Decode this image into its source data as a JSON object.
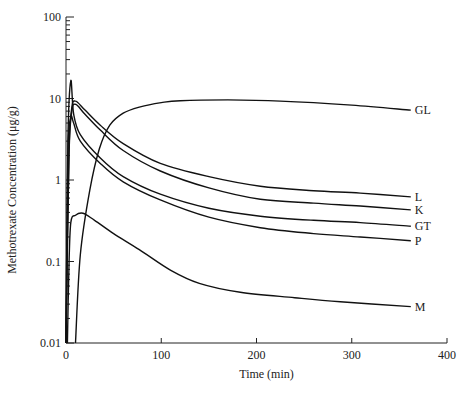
{
  "chart_data": {
    "type": "line",
    "title": "",
    "xlabel": "Time (min)",
    "ylabel": "Methotrexate Concentration (μg/g)",
    "xlim": [
      0,
      400
    ],
    "ylim": [
      0.01,
      100
    ],
    "yscale": "log",
    "grid": false,
    "legend": "direct labels at right end of curves",
    "x_ticks": [
      0,
      100,
      200,
      300,
      400
    ],
    "x_tick_labels": [
      "0",
      "100",
      "200",
      "300",
      "400"
    ],
    "y_ticks": [
      0.01,
      0.1,
      1,
      10,
      100
    ],
    "y_tick_labels": [
      "0.01",
      "0.1",
      "1",
      "10",
      "100"
    ],
    "series": [
      {
        "name": "GL",
        "x": [
          10,
          15,
          25,
          35,
          46,
          60,
          78,
          100,
          120,
          170,
          225,
          300,
          362
        ],
        "y": [
          0.01,
          0.12,
          0.75,
          2.4,
          4.7,
          6.6,
          7.9,
          8.9,
          9.4,
          9.6,
          9.3,
          8.3,
          7.2
        ]
      },
      {
        "name": "L",
        "x": [
          0,
          3,
          6,
          10,
          20,
          36,
          60,
          99,
          150,
          204,
          260,
          309,
          362
        ],
        "y": [
          0.01,
          2.0,
          7.5,
          9.3,
          7.2,
          4.7,
          2.8,
          1.6,
          1.1,
          0.84,
          0.74,
          0.69,
          0.62
        ]
      },
      {
        "name": "K",
        "x": [
          0,
          3,
          6,
          10,
          20,
          36,
          60,
          99,
          150,
          204,
          260,
          309,
          362
        ],
        "y": [
          0.01,
          1.8,
          6.8,
          8.5,
          6.4,
          4.1,
          2.3,
          1.29,
          0.8,
          0.58,
          0.52,
          0.48,
          0.43
        ]
      },
      {
        "name": "GT",
        "x": [
          0,
          2,
          5,
          8,
          15,
          36,
          60,
          99,
          150,
          204,
          260,
          309,
          362
        ],
        "y": [
          0.01,
          3.0,
          16.5,
          6.5,
          3.6,
          1.86,
          1.1,
          0.67,
          0.45,
          0.36,
          0.32,
          0.3,
          0.27
        ]
      },
      {
        "name": "P",
        "x": [
          0,
          2,
          5,
          8,
          15,
          36,
          60,
          99,
          150,
          204,
          260,
          309,
          362
        ],
        "y": [
          0.01,
          2.0,
          5.8,
          5.0,
          3.0,
          1.6,
          0.95,
          0.57,
          0.35,
          0.26,
          0.22,
          0.2,
          0.18
        ]
      },
      {
        "name": "M",
        "x": [
          1.5,
          3,
          5,
          10,
          18,
          30,
          50,
          77,
          110,
          140,
          183,
          240,
          288,
          362
        ],
        "y": [
          0.01,
          0.08,
          0.3,
          0.37,
          0.39,
          0.32,
          0.22,
          0.14,
          0.078,
          0.054,
          0.042,
          0.036,
          0.032,
          0.028
        ]
      }
    ]
  }
}
